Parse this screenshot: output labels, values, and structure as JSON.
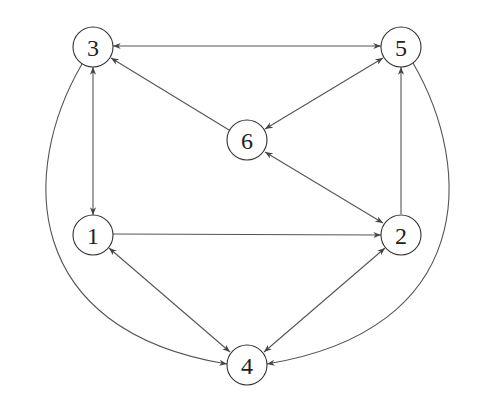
{
  "graph": {
    "nodes": [
      {
        "id": "3",
        "label": "3",
        "x": 93,
        "y": 47
      },
      {
        "id": "5",
        "label": "5",
        "x": 401,
        "y": 47
      },
      {
        "id": "6",
        "label": "6",
        "x": 247,
        "y": 140
      },
      {
        "id": "1",
        "label": "1",
        "x": 93,
        "y": 235
      },
      {
        "id": "2",
        "label": "2",
        "x": 401,
        "y": 235
      },
      {
        "id": "4",
        "label": "4",
        "x": 247,
        "y": 365
      }
    ],
    "edges": [
      {
        "from": "3",
        "to": "5",
        "directed": "both"
      },
      {
        "from": "3",
        "to": "1",
        "directed": "both"
      },
      {
        "from": "6",
        "to": "3",
        "directed": "forward"
      },
      {
        "from": "6",
        "to": "5",
        "directed": "both"
      },
      {
        "from": "6",
        "to": "2",
        "directed": "both"
      },
      {
        "from": "1",
        "to": "2",
        "directed": "forward"
      },
      {
        "from": "2",
        "to": "5",
        "directed": "forward"
      },
      {
        "from": "1",
        "to": "4",
        "directed": "both"
      },
      {
        "from": "2",
        "to": "4",
        "directed": "both"
      },
      {
        "from": "3",
        "to": "4",
        "directed": "forward",
        "curved": true
      },
      {
        "from": "5",
        "to": "4",
        "directed": "forward",
        "curved": true
      }
    ],
    "colors": {
      "stroke": "#555555",
      "node_stroke": "#333333",
      "background": "#ffffff"
    }
  }
}
